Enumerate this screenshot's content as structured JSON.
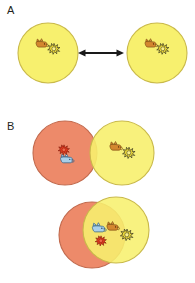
{
  "figure": {
    "width": 195,
    "height": 283,
    "background": "#ffffff",
    "panels": [
      {
        "id": "A",
        "label": "A",
        "label_x": 7,
        "label_y": 5,
        "description": "Two separate identical yellow circles connected by a double-headed arrow"
      },
      {
        "id": "B",
        "label": "B",
        "label_x": 7,
        "label_y": 121,
        "description": "An orange circle and a yellow circle shown slightly overlapping above and heavily overlapping below"
      }
    ]
  },
  "colors": {
    "yellow_fill": "#f7f06e",
    "yellow_fill_light": "#f9f479",
    "yellow_stroke": "#c9b94a",
    "orange_fill": "#ed8a6a",
    "orange_stroke": "#c26a4d",
    "overlap_fill": "#fbc84a",
    "arrow": "#1a1a1a",
    "label_text": "#231f20",
    "icon_brown": "#d4872f",
    "icon_brown_dark": "#9a5a18",
    "icon_blue": "#9ec9e8",
    "icon_blue_dark": "#4a7ea8",
    "icon_sun_yellow": "#f5e03a",
    "icon_sun_outline": "#1a1a1a",
    "icon_star_red": "#e03a20",
    "icon_star_red_dark": "#8a1a08"
  },
  "panel_a": {
    "left_circle": {
      "name": "yellow-circle-left",
      "cx": 48,
      "cy": 53,
      "r": 30,
      "fill_color_key": "yellow_fill",
      "icons": [
        "brown-animal-icon",
        "yellow-starburst-icon"
      ]
    },
    "right_circle": {
      "name": "yellow-circle-right",
      "cx": 157,
      "cy": 53,
      "r": 30,
      "fill_color_key": "yellow_fill",
      "icons": [
        "brown-animal-icon",
        "yellow-starburst-icon"
      ]
    },
    "arrow": {
      "name": "double-headed-arrow",
      "x1": 80,
      "x2": 122,
      "y": 53,
      "double_headed": true
    }
  },
  "panel_b": {
    "top_pair": {
      "orange_circle": {
        "name": "orange-circle-top",
        "cx": 65,
        "cy": 153,
        "r": 32,
        "fill_color_key": "orange_fill",
        "icons": [
          "red-starburst-icon",
          "blue-animal-icon"
        ]
      },
      "yellow_circle": {
        "name": "yellow-circle-top",
        "cx": 122,
        "cy": 153,
        "r": 32,
        "fill_color_key": "yellow_fill",
        "icons": [
          "brown-animal-icon",
          "yellow-starburst-icon"
        ]
      },
      "overlap": "small"
    },
    "bottom_pair": {
      "orange_circle": {
        "name": "orange-circle-bottom",
        "cx": 93,
        "cy": 234,
        "r": 33,
        "fill_color_key": "orange_fill"
      },
      "yellow_circle": {
        "name": "yellow-circle-bottom",
        "cx": 116,
        "cy": 231,
        "r": 33,
        "fill_color_key": "yellow_fill"
      },
      "overlap": "large",
      "icons": [
        "blue-animal-icon",
        "brown-animal-icon",
        "red-starburst-icon",
        "yellow-starburst-icon"
      ]
    }
  },
  "icons": {
    "brown_animal": "brown-animal-icon",
    "blue_animal": "blue-animal-icon",
    "yellow_starburst": "yellow-starburst-icon",
    "red_starburst": "red-starburst-icon"
  }
}
